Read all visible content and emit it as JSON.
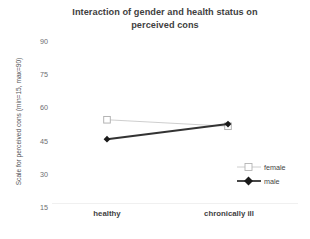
{
  "chart_data": {
    "type": "line",
    "title": "Interaction of gender and health status on perceived cons",
    "title_line1": "Interaction of gender and health status on",
    "title_line2": "perceived cons",
    "xlabel": "",
    "ylabel": "Scale for perceived cons  (min=15, max=90)",
    "categories": [
      "healthy",
      "chronically ill"
    ],
    "yticks": [
      90,
      75,
      60,
      45,
      30,
      15
    ],
    "ylim": [
      15,
      90
    ],
    "grid": false,
    "legend_position": "right-inside-bottom",
    "series": [
      {
        "name": "female",
        "values": [
          54,
          51
        ],
        "color": "#c8c8c8",
        "marker": "open-square",
        "linestyle": "solid-thin"
      },
      {
        "name": "male",
        "values": [
          45,
          52
        ],
        "color": "#333333",
        "marker": "filled-diamond",
        "linestyle": "solid-thick"
      }
    ]
  },
  "colors": {
    "title": "#3f3f3f",
    "tick": "#6d6e71",
    "axis_line": "#f0f0f0",
    "female": "#c8c8c8",
    "male": "#333333",
    "background": "#ffffff"
  },
  "legend": {
    "items": [
      {
        "label": "female"
      },
      {
        "label": "male"
      }
    ]
  }
}
